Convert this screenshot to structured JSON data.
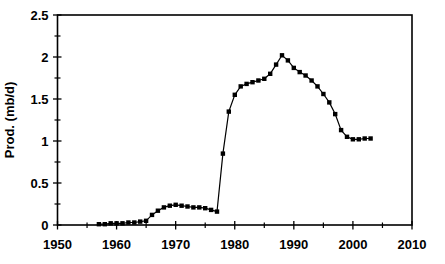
{
  "chart_data": {
    "type": "line",
    "title": "",
    "xlabel": "",
    "ylabel": "Prod. (mb/d)",
    "xlim": [
      1950,
      2010
    ],
    "ylim": [
      0,
      2.5
    ],
    "grid": "off",
    "legend": "none",
    "marker": "filled-square",
    "marker_size": 4.4,
    "line_color": "#000000",
    "marker_color": "#000000",
    "axis_color": "#000000",
    "background_color": "#ffffff",
    "x_major_ticks": {
      "values": [
        1950,
        1960,
        1970,
        1980,
        1990,
        2000,
        2010
      ],
      "labels": [
        "1950",
        "1960",
        "1970",
        "1980",
        "1990",
        "2000",
        "2010"
      ]
    },
    "x_minor_ticks": [
      1955,
      1965,
      1975,
      1985,
      1995,
      2005
    ],
    "y_major_ticks": {
      "values": [
        0,
        0.5,
        1,
        1.5,
        2,
        2.5
      ],
      "labels": [
        "0",
        "0.5",
        "1",
        "1.5",
        "2",
        "2.5"
      ]
    },
    "y_minor_ticks": [
      0.25,
      0.75,
      1.25,
      1.75,
      2.25
    ],
    "series": [
      {
        "name": "production",
        "x": [
          1957,
          1958,
          1959,
          1960,
          1961,
          1962,
          1963,
          1964,
          1965,
          1966,
          1967,
          1968,
          1969,
          1970,
          1971,
          1972,
          1973,
          1974,
          1975,
          1976,
          1977,
          1978,
          1979,
          1980,
          1981,
          1982,
          1983,
          1984,
          1985,
          1986,
          1987,
          1988,
          1989,
          1990,
          1991,
          1992,
          1993,
          1994,
          1995,
          1996,
          1997,
          1998,
          1999,
          2000,
          2001,
          2002,
          2003
        ],
        "y": [
          0.01,
          0.01,
          0.02,
          0.02,
          0.02,
          0.03,
          0.03,
          0.04,
          0.05,
          0.12,
          0.17,
          0.21,
          0.23,
          0.24,
          0.23,
          0.22,
          0.21,
          0.21,
          0.2,
          0.18,
          0.16,
          0.85,
          1.35,
          1.55,
          1.65,
          1.68,
          1.7,
          1.72,
          1.74,
          1.8,
          1.91,
          2.02,
          1.96,
          1.87,
          1.82,
          1.78,
          1.72,
          1.65,
          1.56,
          1.46,
          1.32,
          1.13,
          1.05,
          1.02,
          1.02,
          1.03,
          1.03
        ]
      }
    ]
  }
}
